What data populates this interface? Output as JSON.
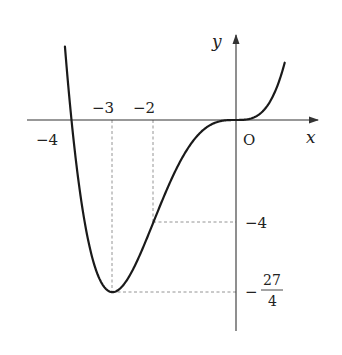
{
  "chart_data": {
    "type": "line",
    "title": "",
    "function": "y = x^4/4 + x^3",
    "xlabel": "x",
    "ylabel": "y",
    "origin_label": "O",
    "x_ticks": [
      {
        "value": -4,
        "label": "−4"
      },
      {
        "value": -3,
        "label": "−3"
      },
      {
        "value": -2,
        "label": "−2"
      }
    ],
    "y_ticks": [
      {
        "value": -4,
        "label": "−4"
      },
      {
        "value": -6.75,
        "label": "−27/4",
        "sign": "−",
        "numerator": "27",
        "denominator": "4"
      }
    ],
    "key_points": [
      {
        "x": -4,
        "y": 0,
        "note": "x-intercept"
      },
      {
        "x": -3,
        "y": -6.75,
        "note": "minimum"
      },
      {
        "x": -2,
        "y": -4,
        "note": "inflection point"
      },
      {
        "x": 0,
        "y": 0,
        "note": "origin, stationary inflection"
      }
    ],
    "xlim": [
      -4.9,
      2.0
    ],
    "ylim": [
      -8.2,
      3.3
    ],
    "grid": false,
    "legend": null,
    "colors": {
      "curve": "#1a1a1a",
      "axis": "#333333",
      "guide": "#888888"
    }
  }
}
